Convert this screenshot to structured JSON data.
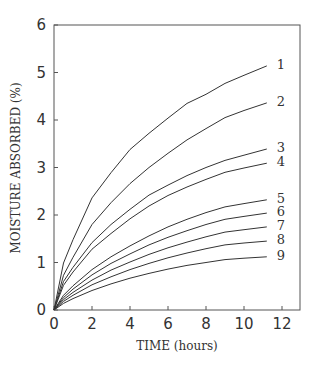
{
  "chart_data": {
    "type": "line",
    "title": "",
    "xlabel": "TIME (hours)",
    "ylabel": "MOISTURE ABSORBED (%)",
    "xlim": [
      0,
      13
    ],
    "ylim": [
      0,
      6
    ],
    "xticks": [
      0,
      2,
      4,
      6,
      8,
      10,
      12
    ],
    "yticks": [
      0,
      1,
      2,
      3,
      4,
      5,
      6
    ],
    "grid": false,
    "legend": "inline-right",
    "x": [
      0,
      0.5,
      1,
      2,
      3,
      4,
      5,
      6,
      7,
      8,
      9,
      10,
      11.2
    ],
    "series": [
      {
        "name": "1",
        "values": [
          0,
          0.99,
          1.48,
          2.36,
          2.89,
          3.38,
          3.72,
          4.04,
          4.35,
          4.54,
          4.77,
          4.94,
          5.14
        ]
      },
      {
        "name": "2",
        "values": [
          0,
          0.73,
          1.11,
          1.8,
          2.26,
          2.66,
          3.0,
          3.3,
          3.58,
          3.82,
          4.05,
          4.2,
          4.36
        ]
      },
      {
        "name": "3",
        "values": [
          0,
          0.6,
          0.9,
          1.42,
          1.8,
          2.12,
          2.42,
          2.63,
          2.83,
          3.0,
          3.15,
          3.26,
          3.39
        ]
      },
      {
        "name": "4",
        "values": [
          0,
          0.52,
          0.8,
          1.28,
          1.61,
          1.92,
          2.19,
          2.41,
          2.59,
          2.75,
          2.9,
          2.99,
          3.09
        ]
      },
      {
        "name": "5",
        "values": [
          0,
          0.31,
          0.51,
          0.85,
          1.12,
          1.35,
          1.56,
          1.75,
          1.91,
          2.05,
          2.17,
          2.24,
          2.32
        ]
      },
      {
        "name": "6",
        "values": [
          0,
          0.26,
          0.44,
          0.74,
          0.98,
          1.18,
          1.37,
          1.53,
          1.67,
          1.8,
          1.91,
          1.97,
          2.04
        ]
      },
      {
        "name": "7",
        "values": [
          0,
          0.22,
          0.37,
          0.63,
          0.84,
          1.01,
          1.17,
          1.31,
          1.43,
          1.54,
          1.64,
          1.69,
          1.75
        ]
      },
      {
        "name": "8",
        "values": [
          0,
          0.18,
          0.31,
          0.53,
          0.7,
          0.85,
          0.98,
          1.1,
          1.2,
          1.29,
          1.37,
          1.41,
          1.45
        ]
      },
      {
        "name": "9",
        "values": [
          0,
          0.14,
          0.24,
          0.41,
          0.55,
          0.67,
          0.77,
          0.86,
          0.94,
          1.0,
          1.06,
          1.09,
          1.12
        ]
      }
    ]
  }
}
